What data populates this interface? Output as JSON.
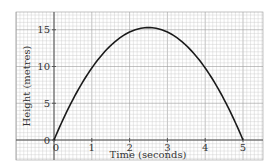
{
  "chart_data": {
    "type": "line",
    "title": "",
    "xlabel": "Time (seconds)",
    "ylabel": "Height (metres)",
    "xlim": [
      0,
      5
    ],
    "ylim": [
      0,
      15
    ],
    "x_ticks": [
      0,
      1,
      2,
      3,
      4,
      5
    ],
    "y_ticks": [
      0,
      5,
      10,
      15
    ],
    "grid": true,
    "legend": null,
    "series": [
      {
        "name": "Height",
        "x": [
          0,
          0.5,
          1,
          1.5,
          2,
          2.5,
          3,
          3.5,
          4,
          4.5,
          5
        ],
        "values": [
          0,
          5.5,
          9.8,
          12.9,
          14.7,
          15.3,
          14.7,
          12.9,
          9.8,
          5.5,
          0
        ]
      }
    ],
    "annotations": {
      "peak": {
        "x": 2.5,
        "y": 15.3
      }
    }
  },
  "labels": {
    "xlabel": "Time (seconds)",
    "ylabel": "Height (metres)",
    "x_ticks": [
      "0",
      "1",
      "2",
      "3",
      "4",
      "5"
    ],
    "y_ticks": [
      "0",
      "5",
      "10",
      "15"
    ]
  },
  "colors": {
    "grid": "#c8c8c8",
    "grid_major": "#9a9a9a",
    "axis": "#555555",
    "curve": "#1a1a1a"
  }
}
